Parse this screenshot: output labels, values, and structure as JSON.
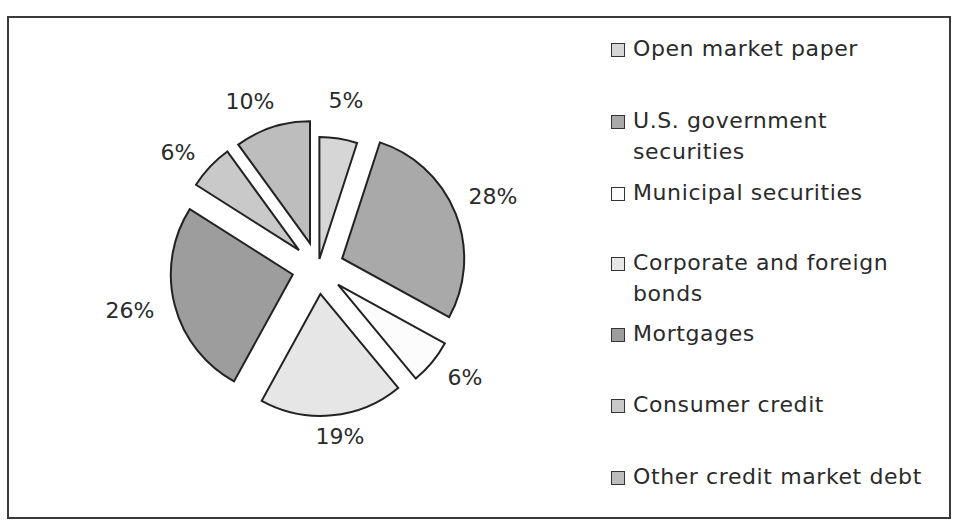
{
  "chart_data": {
    "type": "pie",
    "title": "",
    "exploded": true,
    "legend_position": "right",
    "categories": [
      "Open market paper",
      "U.S. government securities",
      "Municipal securities",
      "Corporate and foreign bonds",
      "Mortgages",
      "Consumer credit",
      "Other credit market debt"
    ],
    "values": [
      5,
      28,
      6,
      19,
      26,
      6,
      10
    ],
    "value_labels": [
      "5%",
      "28%",
      "6%",
      "19%",
      "26%",
      "6%",
      "10%"
    ],
    "colors": [
      "#d6d6d6",
      "#a9a9a9",
      "#fcfcfc",
      "#e6e6e6",
      "#9d9d9d",
      "#c9c9c9",
      "#bdbdbd"
    ]
  },
  "legend": {
    "items": [
      {
        "lines": [
          "Open market paper"
        ],
        "color": "#d6d6d6"
      },
      {
        "lines": [
          "U.S. government",
          "securities"
        ],
        "color": "#a9a9a9"
      },
      {
        "lines": [
          "Municipal securities"
        ],
        "color": "#fcfcfc"
      },
      {
        "lines": [
          "Corporate and foreign",
          "bonds"
        ],
        "color": "#e6e6e6"
      },
      {
        "lines": [
          "Mortgages"
        ],
        "color": "#9d9d9d"
      },
      {
        "lines": [
          "Consumer credit"
        ],
        "color": "#c9c9c9"
      },
      {
        "lines": [
          "Other credit market debt"
        ],
        "color": "#bdbdbd"
      }
    ]
  }
}
